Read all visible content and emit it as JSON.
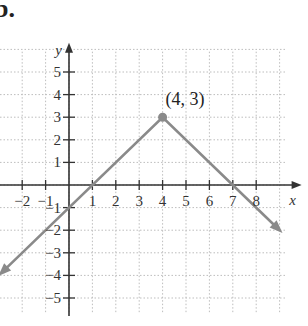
{
  "part_label": "b.",
  "chart_data": {
    "type": "line",
    "title": "",
    "xlabel": "x",
    "ylabel": "y",
    "xlim": [
      -3,
      9.5
    ],
    "ylim": [
      -5.8,
      5.8
    ],
    "grid": true,
    "x_ticks": [
      -2,
      -1,
      1,
      2,
      3,
      4,
      5,
      6,
      7,
      8
    ],
    "y_ticks": [
      5,
      4,
      3,
      2,
      1,
      -1,
      -2,
      -3,
      -4,
      -5
    ],
    "x_tick_labels": [
      "−2",
      "−1",
      "1",
      "2",
      "3",
      "4",
      "5",
      "6",
      "7",
      "8"
    ],
    "y_tick_labels": [
      "5",
      "4",
      "3",
      "2",
      "1",
      "−1",
      "−2",
      "−3",
      "−4",
      "−5"
    ],
    "series": [
      {
        "name": "y = -|x - 4| + 3",
        "description": "Absolute value function opening downward with vertex at (4, 3); arrows at both ends",
        "points": [
          [
            -2.9,
            -3.9
          ],
          [
            4,
            3
          ],
          [
            9.0,
            -2.0
          ]
        ],
        "color": "#8a8a8a"
      }
    ],
    "annotations": [
      {
        "text": "(4, 3)",
        "x": 4,
        "y": 3,
        "marker": "filled-circle"
      }
    ],
    "intercepts": {
      "x": [
        1,
        7
      ],
      "y": -1
    }
  }
}
